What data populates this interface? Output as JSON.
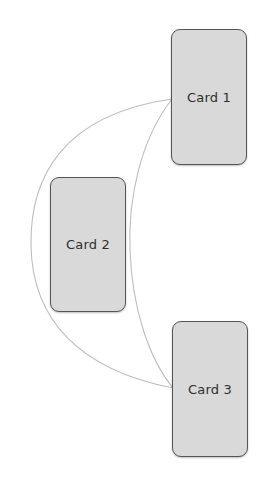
{
  "diagram": {
    "cards": [
      {
        "id": "card-1",
        "label": "Card 1"
      },
      {
        "id": "card-2",
        "label": "Card 2"
      },
      {
        "id": "card-3",
        "label": "Card 3"
      }
    ],
    "connections": [
      {
        "from": "Card 1",
        "to": "Card 3",
        "style": "outer-arc"
      },
      {
        "from": "Card 1",
        "to": "Card 3",
        "style": "inner-arc"
      }
    ],
    "colors": {
      "background": "#ffffff",
      "card_fill": "#d9d9d9",
      "card_border": "#555555",
      "connector": "#bdbdbd",
      "label": "#2e2e2e"
    }
  }
}
